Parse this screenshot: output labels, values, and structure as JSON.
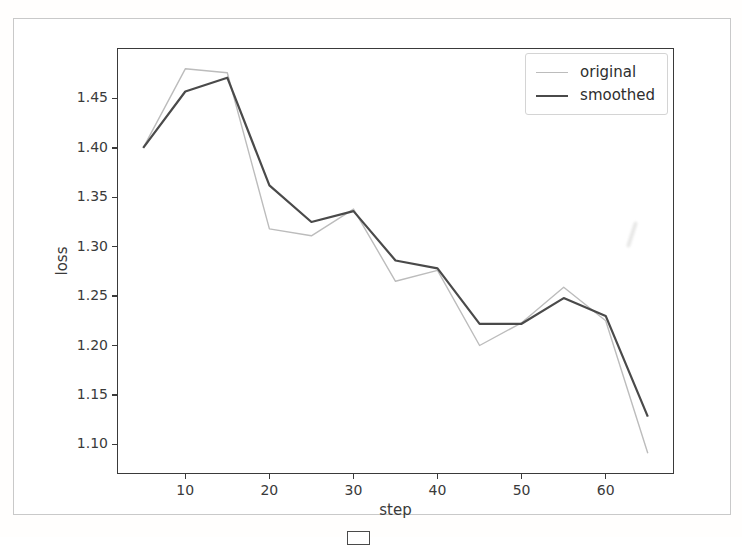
{
  "chart_data": {
    "type": "line",
    "title": "",
    "xlabel": "step",
    "ylabel": "loss",
    "grid": false,
    "x": [
      5,
      10,
      15,
      20,
      25,
      30,
      35,
      40,
      45,
      50,
      55,
      60,
      65
    ],
    "series": [
      {
        "name": "original",
        "color": "#bcbcbc",
        "width": 1.4,
        "values": [
          1.4,
          1.48,
          1.476,
          1.318,
          1.311,
          1.338,
          1.265,
          1.276,
          1.2,
          1.223,
          1.259,
          1.225,
          1.091
        ]
      },
      {
        "name": "smoothed",
        "color": "#4a4a4a",
        "width": 2.2,
        "values": [
          1.4,
          1.457,
          1.471,
          1.362,
          1.325,
          1.336,
          1.286,
          1.278,
          1.222,
          1.222,
          1.248,
          1.23,
          1.128
        ]
      }
    ],
    "xlim": [
      2,
      68
    ],
    "ylim": [
      1.071,
      1.5
    ],
    "x_ticks": [
      {
        "value": 10,
        "label": "10"
      },
      {
        "value": 20,
        "label": "20"
      },
      {
        "value": 30,
        "label": "30"
      },
      {
        "value": 40,
        "label": "40"
      },
      {
        "value": 50,
        "label": "50"
      },
      {
        "value": 60,
        "label": "60"
      }
    ],
    "y_ticks": [
      {
        "value": 1.45,
        "label": "1.45"
      },
      {
        "value": 1.4,
        "label": "1.40"
      },
      {
        "value": 1.35,
        "label": "1.35"
      },
      {
        "value": 1.3,
        "label": "1.30"
      },
      {
        "value": 1.25,
        "label": "1.25"
      },
      {
        "value": 1.2,
        "label": "1.20"
      },
      {
        "value": 1.15,
        "label": "1.15"
      },
      {
        "value": 1.1,
        "label": "1.10"
      }
    ],
    "legend": {
      "position": "upper-right",
      "entries": [
        "original",
        "smoothed"
      ]
    }
  },
  "colors": {
    "axis": "#3a3a3a",
    "frame_border": "#c9c9c9",
    "background": "#ffffff"
  }
}
